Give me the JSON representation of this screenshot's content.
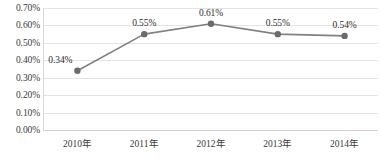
{
  "chart_data": {
    "type": "line",
    "title": "",
    "subtitle": "",
    "xlabel": "",
    "ylabel": "",
    "categories": [
      "2010年",
      "2011年",
      "2012年",
      "2013年",
      "2014年"
    ],
    "values": [
      0.34,
      0.55,
      0.61,
      0.55,
      0.54
    ],
    "point_labels": [
      "0.34%",
      "0.55%",
      "0.61%",
      "0.55%",
      "0.54%"
    ],
    "ylim": [
      0.0,
      0.7
    ],
    "ytick_step": 0.1,
    "ytick_labels": [
      "0.70%",
      "0.60%",
      "0.50%",
      "0.40%",
      "0.30%",
      "0.20%",
      "0.10%",
      "0.00%"
    ],
    "ytick_values": [
      0.7,
      0.6,
      0.5,
      0.4,
      0.3,
      0.2,
      0.1,
      0.0
    ],
    "grid": true,
    "legend": false,
    "legend_position": "none",
    "unit": "%",
    "colors": {
      "line": "#808080",
      "marker": "#6b6b6b",
      "gridline": "#e3e3e3",
      "baseline": "#d2d2d2",
      "axis": "#d8d8d8",
      "text": "#3a3a3a",
      "label_text": "#2e2e2e",
      "background": "#ffffff"
    },
    "style": {
      "line_width": 1.6,
      "marker_radius": 3.2,
      "marker_shape": "circle"
    }
  }
}
